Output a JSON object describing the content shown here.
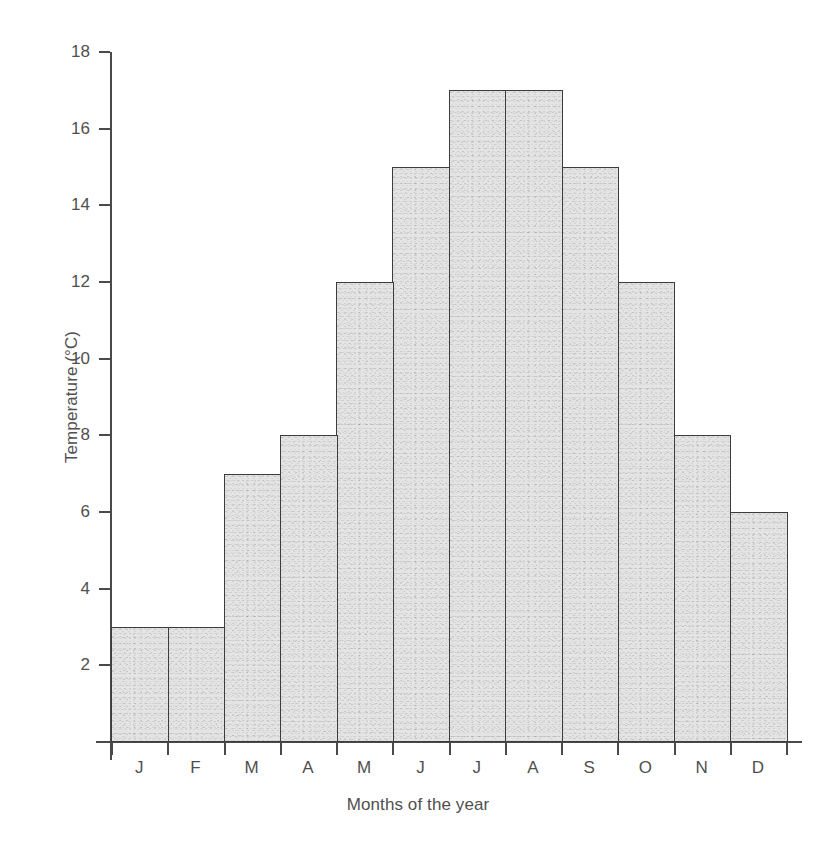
{
  "chart_data": {
    "type": "bar",
    "title": "",
    "xlabel": "Months of the year",
    "ylabel": "Temperature (°C)",
    "categories": [
      "J",
      "F",
      "M",
      "A",
      "M",
      "J",
      "J",
      "A",
      "S",
      "O",
      "N",
      "D"
    ],
    "category_full_names": [
      "January",
      "February",
      "March",
      "April",
      "May",
      "June",
      "July",
      "August",
      "September",
      "October",
      "November",
      "December"
    ],
    "values": [
      3,
      3,
      7,
      8,
      12,
      15,
      17,
      17,
      15,
      12,
      8,
      6
    ],
    "ylim": [
      0,
      18
    ],
    "ytick_values": [
      2,
      4,
      6,
      8,
      10,
      12,
      14,
      16,
      18
    ],
    "ytick_labels": [
      "2",
      "4",
      "6",
      "8",
      "10",
      "12",
      "14",
      "16",
      "18"
    ],
    "ytick_step": 2,
    "grid": false,
    "legend": null,
    "legend_position": "none",
    "bar_gap": 0,
    "colors": {
      "bar_fill": "#e4e4e4",
      "bar_border": "#3c3c3c",
      "axis": "#4a4a4a",
      "text": "#4f4f4f",
      "background": "#ffffff"
    }
  }
}
